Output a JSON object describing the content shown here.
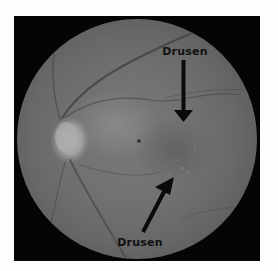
{
  "image": {
    "subject": "retinal fundus photograph",
    "background_color": "#fdfdfd",
    "frame_color": "#050505",
    "fundus_color": "#727272"
  },
  "annotations": [
    {
      "label": "Drusen",
      "position": "top",
      "arrow_direction": "down"
    },
    {
      "label": "Drusen",
      "position": "bottom",
      "arrow_direction": "up-right"
    }
  ]
}
